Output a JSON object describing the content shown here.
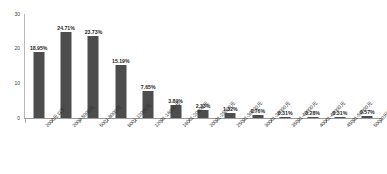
{
  "chart_data": {
    "type": "bar",
    "title": "",
    "xlabel": "",
    "ylabel": "",
    "ylim": [
      0,
      30
    ],
    "yticks": [
      "0",
      "10",
      "20",
      "30"
    ],
    "grid": false,
    "legend": "none",
    "bar_color": "#4d4d4d",
    "background_color": "#ffffff",
    "axis_color": "#9a9a9a",
    "label_rotation": -45,
    "categories": [
      "2000元以下",
      "2000-5000元",
      "5001-8000元",
      "8001-12000元",
      "12001-16000元",
      "16001-20000元",
      "20001-25000元",
      "25001-30000元",
      "30001-35000元",
      "35001-40000元",
      "40001-45000元",
      "45001-50000元",
      "50000元以上"
    ],
    "values": [
      18.95,
      24.71,
      23.73,
      15.19,
      7.65,
      3.89,
      2.33,
      1.32,
      0.76,
      0.31,
      0.28,
      0.31,
      0.57
    ],
    "value_labels": [
      "18.95%",
      "24.71%",
      "23.73%",
      "15.19%",
      "7.65%",
      "3.89%",
      "2.33%",
      "1.32%",
      "0.76%",
      "0.31%",
      "0.28%",
      "0.31%",
      "0.57%"
    ]
  }
}
